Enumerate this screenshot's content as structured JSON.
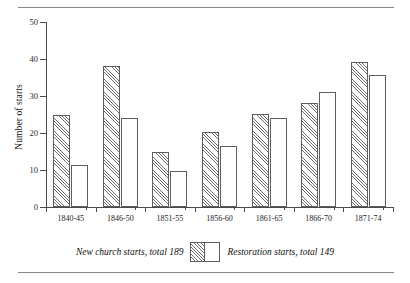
{
  "chart_data": {
    "type": "bar",
    "title": "",
    "xlabel": "",
    "ylabel": "Number of starts",
    "ylim": [
      0,
      50
    ],
    "yticks": [
      0,
      10,
      20,
      30,
      40,
      50
    ],
    "grid": false,
    "legend_position": "bottom-center",
    "categories": [
      "1840-45",
      "1846-50",
      "1851-55",
      "1856-60",
      "1861-65",
      "1866-70",
      "1871-74"
    ],
    "series": [
      {
        "name": "New church starts, total 189",
        "style": "hatched",
        "values": [
          25,
          38,
          15,
          20.3,
          25.2,
          28,
          39.2
        ]
      },
      {
        "name": "Restoration starts, total 149",
        "style": "open",
        "values": [
          11.4,
          24,
          9.6,
          16.5,
          24,
          31,
          35.6
        ]
      }
    ]
  },
  "axes": {
    "y_title": "Number of starts",
    "y_ticks": [
      "50",
      "40",
      "30",
      "20",
      "10",
      "0"
    ],
    "x_ticks": [
      "1840-45",
      "1846-50",
      "1851-55",
      "1856-60",
      "1861-65",
      "1866-70",
      "1871-74"
    ]
  },
  "legend": {
    "left_label": "New church starts, total 189",
    "right_label": "Restoration starts, total 149",
    "left_swatch": "hatched-bar-swatch",
    "right_swatch": "open-bar-swatch"
  },
  "colors": {
    "axis": "#4a4a4a",
    "bar_outline": "#5e5e5e",
    "hatch": "#6d6d6d",
    "rule": "#8a8a8a",
    "background": "#ffffff",
    "text": "#1a1a1a"
  }
}
